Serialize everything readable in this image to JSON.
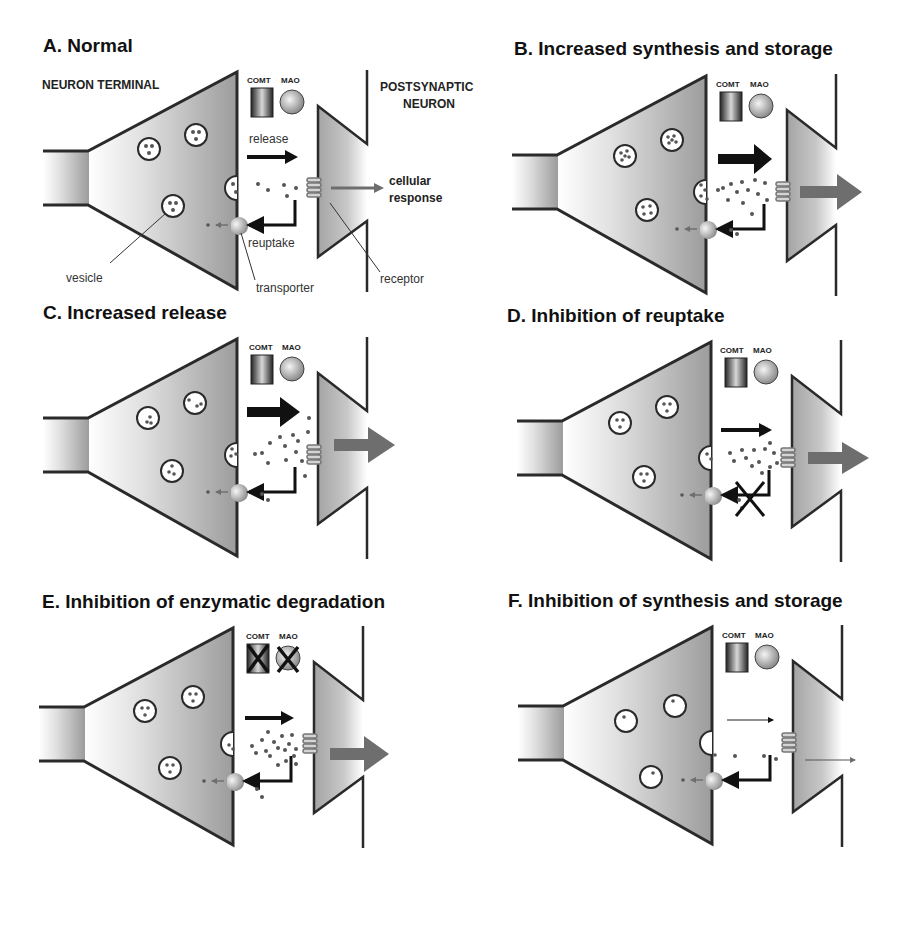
{
  "figure": {
    "panels": [
      {
        "id": "A",
        "title": "A. Normal",
        "condition": "normal",
        "release_arrow": "medium",
        "vesicle_dots": 3,
        "cleft_density": "low",
        "response_arrow": "thin-gray",
        "enzymes_inhibited": false,
        "reuptake_blocked": false
      },
      {
        "id": "B",
        "title": "B. Increased synthesis and storage",
        "condition": "increased-synthesis",
        "release_arrow": "large",
        "vesicle_dots": 6,
        "cleft_density": "high",
        "response_arrow": "large-gray",
        "enzymes_inhibited": false,
        "reuptake_blocked": false
      },
      {
        "id": "C",
        "title": "C. Increased release",
        "condition": "increased-release",
        "release_arrow": "large",
        "vesicle_dots": 3,
        "cleft_density": "high",
        "response_arrow": "large-gray",
        "enzymes_inhibited": false,
        "reuptake_blocked": false
      },
      {
        "id": "D",
        "title": "D. Inhibition of reuptake",
        "condition": "reuptake-inhibition",
        "release_arrow": "medium",
        "vesicle_dots": 3,
        "cleft_density": "high",
        "response_arrow": "large-gray",
        "enzymes_inhibited": false,
        "reuptake_blocked": true
      },
      {
        "id": "E",
        "title": "E. Inhibition of enzymatic degradation",
        "condition": "enzyme-inhibition",
        "release_arrow": "medium",
        "vesicle_dots": 3,
        "cleft_density": "high",
        "response_arrow": "large-gray",
        "enzymes_inhibited": true,
        "reuptake_blocked": false
      },
      {
        "id": "F",
        "title": "F. Inhibition of synthesis and storage",
        "condition": "decreased-synthesis",
        "release_arrow": "thin",
        "vesicle_dots": 1,
        "cleft_density": "very-low",
        "response_arrow": "thin-line",
        "enzymes_inhibited": false,
        "reuptake_blocked": false
      }
    ],
    "labels": {
      "neuron_terminal": "NEURON TERMINAL",
      "postsynaptic_1": "POSTSYNAPTIC",
      "postsynaptic_2": "NEURON",
      "comt": "COMT",
      "mao": "MAO",
      "release": "release",
      "reuptake": "reuptake",
      "cellular_1": "cellular",
      "cellular_2": "response",
      "vesicle": "vesicle",
      "transporter": "transporter",
      "receptor": "receptor"
    },
    "colors": {
      "outline": "#2a2a2a",
      "fill_dark": "#a9a9a9",
      "fill_light": "#ffffff",
      "response_arrow": "#6e6e6e",
      "dot": "#555555"
    }
  }
}
